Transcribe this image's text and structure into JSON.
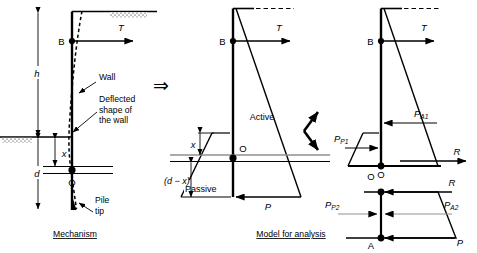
{
  "figure": {
    "panels": [
      {
        "id": "mechanism",
        "caption": "Mechanism"
      },
      {
        "id": "model",
        "caption": "Model for analysis"
      }
    ]
  },
  "colors": {
    "line": "#000000",
    "gray_line": "#808080",
    "hatch": "#9a9a9a",
    "background": "#ffffff"
  },
  "panel_mechanism": {
    "caption": "Mechanism",
    "labels": {
      "point_b": "B",
      "point_o": "O",
      "force_t": "T",
      "dim_h": "h",
      "dim_d": "d",
      "dim_x": "x",
      "wall": "Wall",
      "deflected_shape": "Deflected\nshape of\nthe wall",
      "deflected_line1": "Deflected",
      "deflected_line2": "shape of",
      "deflected_line3": "the wall",
      "pile_tip": "Pile\ntip",
      "pile_tip_line1": "Pile",
      "pile_tip_line2": "tip"
    }
  },
  "panel_model": {
    "caption": "Model for analysis",
    "labels": {
      "point_b": "B",
      "point_o": "O",
      "force_t": "T",
      "force_p": "P",
      "active": "Active",
      "passive": "Passive",
      "dim_x": "x",
      "dim_dx": "(d − x)"
    }
  },
  "panel_upper_right": {
    "labels": {
      "point_b": "B",
      "point_o": "O",
      "force_t": "T",
      "force_r": "R",
      "p_a1": "P",
      "p_a1_sub": "A1",
      "p_p1": "P",
      "p_p1_sub": "P1"
    }
  },
  "panel_lower_right": {
    "labels": {
      "point_a": "A",
      "point_o": "O",
      "force_r": "R",
      "force_p": "P",
      "p_a2": "P",
      "p_a2_sub": "A2",
      "p_p2": "P",
      "p_p2_sub": "P2"
    }
  },
  "transition": {
    "implies_arrow": "⇒",
    "split_arrow": "split-arrow"
  }
}
